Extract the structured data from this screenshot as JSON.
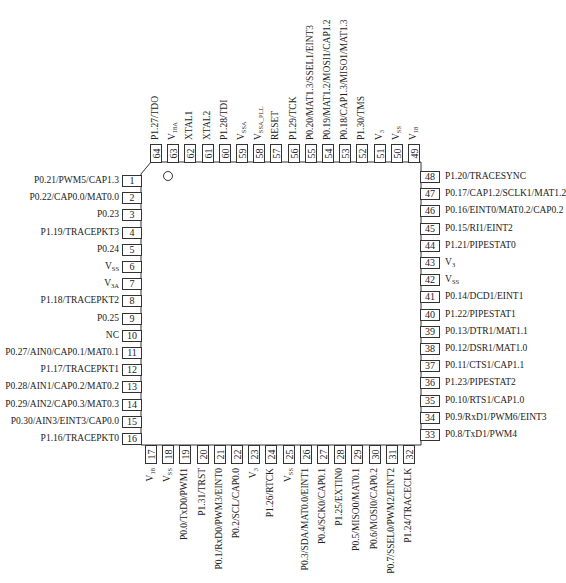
{
  "diagram": {
    "type": "IC pinout",
    "package": "64-pin LQFP",
    "pin1_marker": "circle",
    "left_pins": [
      {
        "num": "1",
        "label": "P0.21/PWM5/CAP1.3"
      },
      {
        "num": "2",
        "label": "P0.22/CAP0.0/MAT0.0"
      },
      {
        "num": "3",
        "label": "P0.23"
      },
      {
        "num": "4",
        "label": "P1.19/TRACEPKT3"
      },
      {
        "num": "5",
        "label": "P0.24"
      },
      {
        "num": "6",
        "label": "V",
        "sub": "SS"
      },
      {
        "num": "7",
        "label": "V",
        "sub": "3A"
      },
      {
        "num": "8",
        "label": "P1.18/TRACEPKT2"
      },
      {
        "num": "9",
        "label": "P0.25"
      },
      {
        "num": "10",
        "label": "NC"
      },
      {
        "num": "11",
        "label": "P0.27/AIN0/CAP0.1/MAT0.1"
      },
      {
        "num": "12",
        "label": "P1.17/TRACEPKT1"
      },
      {
        "num": "13",
        "label": "P0.28/AIN1/CAP0.2/MAT0.2"
      },
      {
        "num": "14",
        "label": "P0.29/AIN2/CAP0.3/MAT0.3"
      },
      {
        "num": "15",
        "label": "P0.30/AIN3/EINT3/CAP0.0"
      },
      {
        "num": "16",
        "label": "P1.16/TRACEPKT0"
      }
    ],
    "bottom_pins": [
      {
        "num": "17",
        "label": "V",
        "sub": "18"
      },
      {
        "num": "18",
        "label": "V",
        "sub": "SS"
      },
      {
        "num": "19",
        "label": "P0.0/TxD0/PWM1"
      },
      {
        "num": "20",
        "label": "P1.31/TRST"
      },
      {
        "num": "21",
        "label": "P0.1/RxD0/PWM3/EINT0"
      },
      {
        "num": "22",
        "label": "P0.2/SCL/CAP0.0"
      },
      {
        "num": "23",
        "label": "V",
        "sub": "3"
      },
      {
        "num": "24",
        "label": "P1.26/RTCK"
      },
      {
        "num": "25",
        "label": "V",
        "sub": "SS"
      },
      {
        "num": "26",
        "label": "P0.3/SDA/MAT0.0/EINT1"
      },
      {
        "num": "27",
        "label": "P0.4/SCK0/CAP0.1"
      },
      {
        "num": "28",
        "label": "P1.25/EXTIN0"
      },
      {
        "num": "29",
        "label": "P0.5/MISO0/MAT0.1"
      },
      {
        "num": "30",
        "label": "P0.6/MOSI0/CAP0.2"
      },
      {
        "num": "31",
        "label": "P0.7/SSEL0/PWM2/EINT2"
      },
      {
        "num": "32",
        "label": "P1.24/TRACECLK"
      }
    ],
    "right_pins": [
      {
        "num": "48",
        "label": "P1.20/TRACESYNC"
      },
      {
        "num": "47",
        "label": "P0.17/CAP1.2/SCLK1/MAT1.2"
      },
      {
        "num": "46",
        "label": "P0.16/EINT0/MAT0.2/CAP0.2"
      },
      {
        "num": "45",
        "label": "P0.15/RI1/EINT2"
      },
      {
        "num": "44",
        "label": "P1.21/PIPESTAT0"
      },
      {
        "num": "43",
        "label": "V",
        "sub": "3"
      },
      {
        "num": "42",
        "label": "V",
        "sub": "SS"
      },
      {
        "num": "41",
        "label": "P0.14/DCD1/EINT1"
      },
      {
        "num": "40",
        "label": "P1.22/PIPESTAT1"
      },
      {
        "num": "39",
        "label": "P0.13/DTR1/MAT1.1"
      },
      {
        "num": "38",
        "label": "P0.12/DSR1/MAT1.0"
      },
      {
        "num": "37",
        "label": "P0.11/CTS1/CAP1.1"
      },
      {
        "num": "36",
        "label": "P1.23/PIPESTAT2"
      },
      {
        "num": "35",
        "label": "P0.10/RTS1/CAP1.0"
      },
      {
        "num": "34",
        "label": "P0.9/RxD1/PWM6/EINT3"
      },
      {
        "num": "33",
        "label": "P0.8/TxD1/PWM4"
      }
    ],
    "top_pins": [
      {
        "num": "64",
        "label": "P1.27/TDO"
      },
      {
        "num": "63",
        "label": "V",
        "sub": "18A"
      },
      {
        "num": "62",
        "label": "XTAL1"
      },
      {
        "num": "61",
        "label": "XTAL2"
      },
      {
        "num": "60",
        "label": "P1.28/TDI"
      },
      {
        "num": "59",
        "label": "V",
        "sub": "SSA"
      },
      {
        "num": "58",
        "label": "V",
        "sub": "SSA_PLL"
      },
      {
        "num": "57",
        "label": "RESET"
      },
      {
        "num": "56",
        "label": "P1.29/TCK"
      },
      {
        "num": "55",
        "label": "P0.20/MAT1.3/SSEL1/EINT3"
      },
      {
        "num": "54",
        "label": "P0.19/MAT1.2/MOSI1/CAP1.2"
      },
      {
        "num": "53",
        "label": "P0.18/CAP1.3/MISO1/MAT1.3"
      },
      {
        "num": "52",
        "label": "P1.30/TMS"
      },
      {
        "num": "51",
        "label": "V",
        "sub": "3"
      },
      {
        "num": "50",
        "label": "V",
        "sub": "SS"
      },
      {
        "num": "49",
        "label": "V",
        "sub": "18"
      }
    ]
  }
}
